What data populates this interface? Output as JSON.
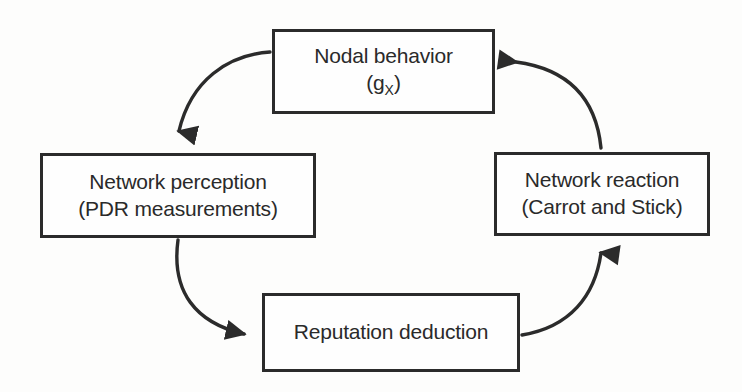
{
  "diagram": {
    "type": "cycle-flow",
    "stroke_color": "#2b2b2b",
    "text_color": "#2a2a2a",
    "background_color": "#fdfdfc",
    "nodes": [
      {
        "id": "nodal-behavior",
        "line1": "Nodal behavior",
        "line2_prefix": "(g",
        "line2_subscript": "X",
        "line2_suffix": ")"
      },
      {
        "id": "network-perception",
        "line1": "Network perception",
        "line2": "(PDR measurements)"
      },
      {
        "id": "network-reaction",
        "line1": "Network reaction",
        "line2": "(Carrot and Stick)"
      },
      {
        "id": "reputation-deduction",
        "line1": "Reputation deduction"
      }
    ],
    "edges": [
      {
        "id": "edge-behavior-to-perception",
        "from": "nodal-behavior",
        "to": "network-perception",
        "style": "curved-arrow",
        "direction": "down-left"
      },
      {
        "id": "edge-perception-to-reputation",
        "from": "network-perception",
        "to": "reputation-deduction",
        "style": "curved-arrow",
        "direction": "down-right"
      },
      {
        "id": "edge-reputation-to-reaction",
        "from": "reputation-deduction",
        "to": "network-reaction",
        "style": "curved-arrow",
        "direction": "up-right"
      },
      {
        "id": "edge-reaction-to-behavior",
        "from": "network-reaction",
        "to": "nodal-behavior",
        "style": "curved-arrow",
        "direction": "up-left"
      }
    ]
  }
}
